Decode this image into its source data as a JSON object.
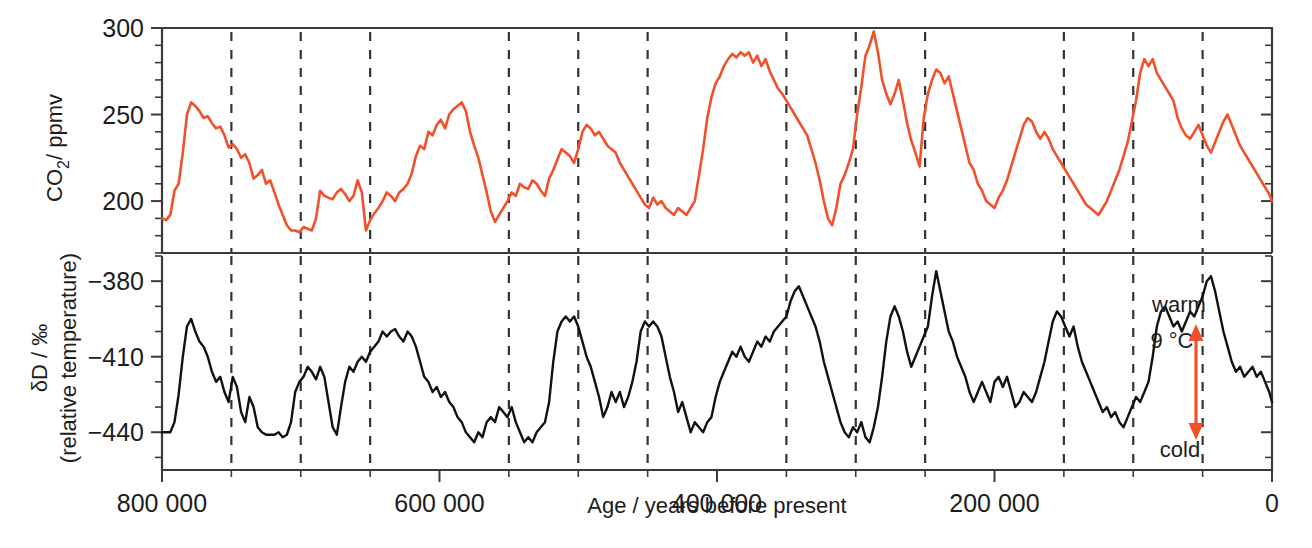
{
  "figure": {
    "background": "#ffffff",
    "xlabel": "Age / years before present",
    "x_tick_labels": [
      "800 000",
      "600 000",
      "400 000",
      "200 000",
      "0"
    ],
    "x_major_ticks": [
      800000,
      600000,
      400000,
      200000,
      0
    ],
    "x_minor_ticks": [
      750000,
      700000,
      650000,
      550000,
      500000,
      450000,
      350000,
      300000,
      250000,
      150000,
      100000,
      50000
    ],
    "gridlines_at": [
      750000,
      700000,
      650000,
      550000,
      500000,
      450000,
      350000,
      300000,
      250000,
      150000,
      100000,
      50000
    ],
    "grid_style": "dashed",
    "xlim": [
      800000,
      0
    ],
    "colors": {
      "co2": "#F0512B",
      "deuterium": "#111111",
      "axis": "#3a3a3a",
      "grid": "#333333",
      "annotation_arrow": "#F0512B"
    }
  },
  "annotations": {
    "warm_label": "warm",
    "delta_t_label": "9 °C",
    "cold_label": "cold"
  },
  "chart_data": [
    {
      "type": "line",
      "panel": "top",
      "title": "",
      "xlabel": "Age / years before present",
      "ylabel": "CO2 / ppmv",
      "ylabel_parts": {
        "main": "CO",
        "sub": "2",
        "unit": "/ ppmv"
      },
      "ylim": [
        170,
        300
      ],
      "y_major_ticks": [
        200,
        250,
        300
      ],
      "y_tick_labels": [
        "200",
        "250",
        "300"
      ],
      "y_minor_step": 10,
      "grid": false,
      "legend": "none",
      "series_name": "CO2",
      "color": "#F0512B",
      "x": [
        800000,
        797000,
        794000,
        791000,
        788000,
        785000,
        782000,
        779000,
        776000,
        773000,
        770000,
        767000,
        764000,
        761000,
        758000,
        755000,
        752000,
        749000,
        746000,
        743000,
        740000,
        737000,
        734000,
        731000,
        728000,
        725000,
        722000,
        719000,
        716000,
        713000,
        710000,
        707000,
        704000,
        701000,
        698000,
        695000,
        692000,
        689000,
        686000,
        683000,
        680000,
        677000,
        674000,
        671000,
        668000,
        665000,
        662000,
        659000,
        656000,
        653000,
        650000,
        647000,
        644000,
        641000,
        638000,
        635000,
        632000,
        629000,
        626000,
        623000,
        620000,
        617000,
        614000,
        611000,
        608000,
        605000,
        602000,
        599000,
        596000,
        593000,
        590000,
        587000,
        584000,
        581000,
        578000,
        575000,
        572000,
        569000,
        566000,
        563000,
        560000,
        557000,
        554000,
        551000,
        548000,
        545000,
        542000,
        539000,
        536000,
        533000,
        530000,
        527000,
        524000,
        521000,
        518000,
        515000,
        512000,
        509000,
        506000,
        503000,
        500000,
        497000,
        494000,
        491000,
        488000,
        485000,
        482000,
        479000,
        476000,
        473000,
        470000,
        467000,
        464000,
        461000,
        458000,
        455000,
        452000,
        449000,
        446000,
        443000,
        440000,
        437000,
        434000,
        431000,
        428000,
        425000,
        422000,
        419000,
        416000,
        413000,
        410000,
        407000,
        404000,
        401000,
        398000,
        395000,
        392000,
        389000,
        386000,
        383000,
        380000,
        377000,
        374000,
        371000,
        368000,
        365000,
        362000,
        359000,
        356000,
        353000,
        350000,
        347000,
        344000,
        341000,
        338000,
        335000,
        332000,
        329000,
        326000,
        323000,
        320000,
        317000,
        314000,
        311000,
        308000,
        305000,
        302000,
        299000,
        296000,
        293000,
        290000,
        287000,
        284000,
        281000,
        278000,
        275000,
        272000,
        269000,
        266000,
        263000,
        260000,
        257000,
        254000,
        251000,
        248000,
        245000,
        242000,
        239000,
        236000,
        233000,
        230000,
        227000,
        224000,
        221000,
        218000,
        215000,
        212000,
        209000,
        206000,
        203000,
        200000,
        197000,
        194000,
        191000,
        188000,
        185000,
        182000,
        179000,
        176000,
        173000,
        170000,
        167000,
        164000,
        161000,
        158000,
        155000,
        152000,
        149000,
        146000,
        143000,
        140000,
        137000,
        134000,
        131000,
        128000,
        125000,
        122000,
        119000,
        116000,
        113000,
        110000,
        107000,
        104000,
        101000,
        98000,
        95000,
        92000,
        89000,
        86000,
        83000,
        80000,
        77000,
        74000,
        71000,
        68000,
        65000,
        62000,
        59000,
        56000,
        53000,
        50000,
        47000,
        44000,
        41000,
        38000,
        35000,
        32000,
        29000,
        26000,
        23000,
        20000,
        17000,
        14000,
        11000,
        8000,
        5000,
        2000,
        0
      ],
      "values": [
        190,
        189,
        192,
        206,
        210,
        228,
        250,
        257,
        255,
        252,
        248,
        249,
        245,
        242,
        243,
        238,
        231,
        233,
        230,
        225,
        227,
        222,
        213,
        215,
        218,
        210,
        212,
        205,
        198,
        192,
        186,
        183,
        183,
        182,
        185,
        184,
        183,
        190,
        206,
        203,
        202,
        201,
        205,
        207,
        204,
        200,
        203,
        212,
        205,
        183,
        189,
        193,
        196,
        200,
        205,
        203,
        200,
        205,
        207,
        210,
        216,
        226,
        232,
        230,
        240,
        238,
        244,
        247,
        242,
        250,
        253,
        255,
        257,
        252,
        240,
        232,
        225,
        215,
        205,
        194,
        188,
        192,
        196,
        200,
        205,
        203,
        210,
        208,
        207,
        212,
        210,
        206,
        203,
        213,
        218,
        224,
        230,
        228,
        226,
        222,
        230,
        240,
        244,
        242,
        238,
        240,
        236,
        232,
        230,
        228,
        222,
        218,
        214,
        210,
        206,
        202,
        198,
        196,
        202,
        198,
        200,
        196,
        194,
        192,
        196,
        194,
        192,
        196,
        200,
        215,
        230,
        248,
        260,
        268,
        272,
        278,
        282,
        285,
        283,
        286,
        284,
        286,
        280,
        284,
        278,
        282,
        275,
        270,
        265,
        262,
        258,
        254,
        250,
        246,
        242,
        238,
        230,
        222,
        212,
        200,
        190,
        186,
        196,
        210,
        215,
        222,
        230,
        250,
        266,
        284,
        290,
        298,
        286,
        270,
        262,
        256,
        262,
        270,
        258,
        245,
        235,
        228,
        220,
        248,
        262,
        270,
        276,
        274,
        268,
        272,
        262,
        252,
        242,
        232,
        222,
        218,
        210,
        206,
        200,
        198,
        196,
        202,
        206,
        212,
        220,
        228,
        236,
        244,
        248,
        246,
        240,
        236,
        240,
        236,
        230,
        226,
        222,
        218,
        214,
        210,
        206,
        202,
        198,
        196,
        194,
        192,
        196,
        200,
        206,
        212,
        218,
        226,
        234,
        246,
        258,
        274,
        282,
        278,
        282,
        274,
        270,
        266,
        262,
        258,
        248,
        242,
        238,
        236,
        240,
        244,
        238,
        232,
        228,
        234,
        240,
        246,
        250,
        244,
        238,
        232,
        228,
        224,
        220,
        216,
        212,
        208,
        204,
        200,
        196,
        192,
        190,
        188,
        192,
        196,
        200,
        206,
        214,
        224,
        238,
        252,
        264,
        272,
        280
      ]
    },
    {
      "type": "line",
      "panel": "bottom",
      "title": "",
      "xlabel": "Age / years before present",
      "ylabel": "δD / ‰ (relative temperature)",
      "ylabel_parts": {
        "main": "δD / ‰",
        "sub": "(relative temperature)"
      },
      "ylim": [
        -455,
        -370
      ],
      "y_major_ticks": [
        -440,
        -410,
        -380
      ],
      "y_tick_labels": [
        "−440",
        "−410",
        "−380"
      ],
      "y_minor_step": 10,
      "grid": false,
      "legend": "none",
      "series_name": "deuterium",
      "color": "#111111",
      "x": [
        800000,
        797000,
        794000,
        791000,
        788000,
        785000,
        782000,
        779000,
        776000,
        773000,
        770000,
        767000,
        764000,
        761000,
        758000,
        755000,
        752000,
        749000,
        746000,
        743000,
        740000,
        737000,
        734000,
        731000,
        728000,
        725000,
        722000,
        719000,
        716000,
        713000,
        710000,
        707000,
        704000,
        701000,
        698000,
        695000,
        692000,
        689000,
        686000,
        683000,
        680000,
        677000,
        674000,
        671000,
        668000,
        665000,
        662000,
        659000,
        656000,
        653000,
        650000,
        647000,
        644000,
        641000,
        638000,
        635000,
        632000,
        629000,
        626000,
        623000,
        620000,
        617000,
        614000,
        611000,
        608000,
        605000,
        602000,
        599000,
        596000,
        593000,
        590000,
        587000,
        584000,
        581000,
        578000,
        575000,
        572000,
        569000,
        566000,
        563000,
        560000,
        557000,
        554000,
        551000,
        548000,
        545000,
        542000,
        539000,
        536000,
        533000,
        530000,
        527000,
        524000,
        521000,
        518000,
        515000,
        512000,
        509000,
        506000,
        503000,
        500000,
        497000,
        494000,
        491000,
        488000,
        485000,
        482000,
        479000,
        476000,
        473000,
        470000,
        467000,
        464000,
        461000,
        458000,
        455000,
        452000,
        449000,
        446000,
        443000,
        440000,
        437000,
        434000,
        431000,
        428000,
        425000,
        422000,
        419000,
        416000,
        413000,
        410000,
        407000,
        404000,
        401000,
        398000,
        395000,
        392000,
        389000,
        386000,
        383000,
        380000,
        377000,
        374000,
        371000,
        368000,
        365000,
        362000,
        359000,
        356000,
        353000,
        350000,
        347000,
        344000,
        341000,
        338000,
        335000,
        332000,
        329000,
        326000,
        323000,
        320000,
        317000,
        314000,
        311000,
        308000,
        305000,
        302000,
        299000,
        296000,
        293000,
        290000,
        287000,
        284000,
        281000,
        278000,
        275000,
        272000,
        269000,
        266000,
        263000,
        260000,
        257000,
        254000,
        251000,
        248000,
        245000,
        242000,
        239000,
        236000,
        233000,
        230000,
        227000,
        224000,
        221000,
        218000,
        215000,
        212000,
        209000,
        206000,
        203000,
        200000,
        197000,
        194000,
        191000,
        188000,
        185000,
        182000,
        179000,
        176000,
        173000,
        170000,
        167000,
        164000,
        161000,
        158000,
        155000,
        152000,
        149000,
        146000,
        143000,
        140000,
        137000,
        134000,
        131000,
        128000,
        125000,
        122000,
        119000,
        116000,
        113000,
        110000,
        107000,
        104000,
        101000,
        98000,
        95000,
        92000,
        89000,
        86000,
        83000,
        80000,
        77000,
        74000,
        71000,
        68000,
        65000,
        62000,
        59000,
        56000,
        53000,
        50000,
        47000,
        44000,
        41000,
        38000,
        35000,
        32000,
        29000,
        26000,
        23000,
        20000,
        17000,
        14000,
        11000,
        8000,
        5000,
        2000,
        0
      ],
      "values": [
        -440,
        -440,
        -440,
        -436,
        -425,
        -410,
        -398,
        -395,
        -400,
        -404,
        -406,
        -410,
        -416,
        -420,
        -418,
        -424,
        -428,
        -418,
        -422,
        -432,
        -436,
        -426,
        -430,
        -438,
        -440,
        -441,
        -441,
        -441,
        -440,
        -442,
        -441,
        -436,
        -424,
        -420,
        -418,
        -414,
        -416,
        -419,
        -414,
        -418,
        -428,
        -438,
        -441,
        -430,
        -420,
        -414,
        -416,
        -412,
        -410,
        -412,
        -408,
        -406,
        -404,
        -400,
        -402,
        -400,
        -399,
        -402,
        -404,
        -400,
        -402,
        -406,
        -412,
        -418,
        -420,
        -424,
        -422,
        -426,
        -424,
        -428,
        -430,
        -434,
        -436,
        -440,
        -442,
        -444,
        -440,
        -442,
        -436,
        -434,
        -436,
        -430,
        -432,
        -434,
        -430,
        -436,
        -440,
        -444,
        -442,
        -444,
        -440,
        -438,
        -436,
        -428,
        -412,
        -400,
        -396,
        -394,
        -396,
        -394,
        -398,
        -404,
        -410,
        -414,
        -420,
        -426,
        -434,
        -430,
        -424,
        -428,
        -424,
        -430,
        -426,
        -420,
        -412,
        -400,
        -396,
        -398,
        -396,
        -398,
        -402,
        -410,
        -418,
        -424,
        -432,
        -428,
        -434,
        -440,
        -436,
        -438,
        -440,
        -436,
        -434,
        -426,
        -420,
        -416,
        -412,
        -408,
        -410,
        -406,
        -410,
        -412,
        -408,
        -404,
        -406,
        -402,
        -404,
        -400,
        -398,
        -396,
        -394,
        -388,
        -384,
        -382,
        -386,
        -390,
        -394,
        -398,
        -404,
        -412,
        -418,
        -424,
        -430,
        -436,
        -440,
        -442,
        -438,
        -440,
        -436,
        -442,
        -444,
        -438,
        -430,
        -418,
        -404,
        -394,
        -390,
        -394,
        -400,
        -408,
        -414,
        -410,
        -406,
        -402,
        -398,
        -386,
        -376,
        -384,
        -392,
        -400,
        -404,
        -410,
        -414,
        -418,
        -424,
        -428,
        -424,
        -420,
        -424,
        -428,
        -420,
        -418,
        -422,
        -418,
        -424,
        -430,
        -428,
        -424,
        -426,
        -428,
        -424,
        -418,
        -412,
        -404,
        -396,
        -392,
        -394,
        -398,
        -402,
        -398,
        -406,
        -412,
        -416,
        -420,
        -424,
        -428,
        -432,
        -430,
        -434,
        -432,
        -436,
        -438,
        -434,
        -430,
        -426,
        -428,
        -424,
        -420,
        -410,
        -398,
        -392,
        -390,
        -394,
        -398,
        -396,
        -400,
        -396,
        -392,
        -394,
        -390,
        -386,
        -380,
        -378,
        -384,
        -392,
        -400,
        -406,
        -412,
        -416,
        -414,
        -418,
        -416,
        -414,
        -418,
        -416,
        -420,
        -424,
        -428,
        -432,
        -436,
        -432,
        -424,
        -418,
        -420,
        -424,
        -428,
        -424,
        -426,
        -430,
        -428,
        -426,
        -428,
        -432,
        -436,
        -440,
        -442,
        -440,
        -442,
        -440,
        -438,
        -440,
        -442,
        -440,
        -436,
        -424,
        -410,
        -400,
        -396,
        -398,
        -394,
        -396,
        -398,
        -394
      ]
    }
  ]
}
